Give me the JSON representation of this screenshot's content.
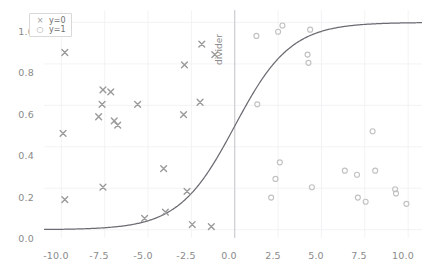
{
  "chart_data": {
    "type": "scatter",
    "title": "",
    "xlabel": "",
    "ylabel": "",
    "xlim": [
      -11.0,
      10.8
    ],
    "ylim": [
      -0.04,
      1.06
    ],
    "xticks": [
      "-10.0",
      "-7.5",
      "-5.0",
      "-2.5",
      "0.0",
      "2.5",
      "5.0",
      "7.5",
      "10.0"
    ],
    "xtick_values": [
      -10.0,
      -7.5,
      -5.0,
      -2.5,
      0.0,
      2.5,
      5.0,
      7.5,
      10.0
    ],
    "yticks": [
      "0.0",
      "0.2",
      "0.4",
      "0.6",
      "0.8",
      "1.0"
    ],
    "ytick_values": [
      0.0,
      0.2,
      0.4,
      0.6,
      0.8,
      1.0
    ],
    "grid": true,
    "legend_position": "upper left",
    "legend": [
      {
        "label": "y=0",
        "marker": "x",
        "color": "#9a9a9a"
      },
      {
        "label": "y=1",
        "marker": "o",
        "color": "#bdbdbd"
      }
    ],
    "annotations": [
      {
        "text": "divider",
        "x": 0.0,
        "rotation": 90,
        "color": "#8d8d8d"
      }
    ],
    "series": [
      {
        "name": "y=0",
        "marker": "x",
        "color": "#9a9a9a",
        "points": [
          [
            -9.8,
            0.855
          ],
          [
            -9.9,
            0.465
          ],
          [
            -9.8,
            0.145
          ],
          [
            -7.6,
            0.675
          ],
          [
            -7.65,
            0.605
          ],
          [
            -7.85,
            0.545
          ],
          [
            -7.6,
            0.205
          ],
          [
            -7.15,
            0.665
          ],
          [
            -6.95,
            0.525
          ],
          [
            -6.75,
            0.505
          ],
          [
            -5.6,
            0.605
          ],
          [
            -5.2,
            0.055
          ],
          [
            -4.1,
            0.295
          ],
          [
            -4.0,
            0.085
          ],
          [
            -2.9,
            0.795
          ],
          [
            -2.95,
            0.555
          ],
          [
            -2.75,
            0.185
          ],
          [
            -2.45,
            0.025
          ],
          [
            -1.9,
            0.895
          ],
          [
            -2.0,
            0.615
          ],
          [
            -1.15,
            0.845
          ],
          [
            -1.35,
            0.015
          ]
        ]
      },
      {
        "name": "y=1",
        "marker": "o",
        "color": "#c2c2c2",
        "points": [
          [
            1.25,
            0.935
          ],
          [
            1.3,
            0.605
          ],
          [
            2.5,
            0.955
          ],
          [
            2.75,
            0.985
          ],
          [
            2.6,
            0.325
          ],
          [
            2.35,
            0.245
          ],
          [
            2.1,
            0.155
          ],
          [
            4.2,
            0.845
          ],
          [
            4.25,
            0.805
          ],
          [
            4.35,
            0.965
          ],
          [
            4.45,
            0.205
          ],
          [
            6.35,
            0.285
          ],
          [
            7.05,
            0.265
          ],
          [
            7.1,
            0.155
          ],
          [
            7.55,
            0.135
          ],
          [
            7.95,
            0.475
          ],
          [
            8.1,
            0.285
          ],
          [
            9.25,
            0.195
          ],
          [
            9.3,
            0.175
          ],
          [
            9.9,
            0.125
          ]
        ]
      },
      {
        "name": "sigmoid",
        "type": "line",
        "color": "#6b6b73",
        "description": "logistic curve 1/(1+exp(-0.62*x)) crossing 0.5 at x=0"
      }
    ]
  },
  "legend": {
    "rows": [
      {
        "symbol": "×",
        "label": "y=0"
      },
      {
        "symbol": "○",
        "label": "y=1"
      }
    ]
  },
  "divider": {
    "label": "divider"
  }
}
